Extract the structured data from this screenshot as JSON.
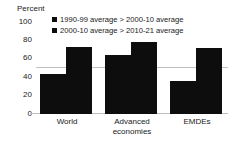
{
  "chart_data": {
    "type": "bar",
    "title": "",
    "xlabel": "",
    "ylabel": "Percent",
    "ylim": [
      0,
      100
    ],
    "yticks": [
      0,
      20,
      40,
      60,
      80,
      100
    ],
    "grid": true,
    "gridlines": [
      50
    ],
    "legend_position": "top",
    "categories": [
      "World",
      "Advanced economies",
      "EMDEs"
    ],
    "category_lines": [
      [
        "World"
      ],
      [
        "Advanced",
        "economies"
      ],
      [
        "EMDEs"
      ]
    ],
    "series": [
      {
        "name": "1990-99 average > 2000-10 average",
        "values": [
          44,
          64,
          36
        ]
      },
      {
        "name": "2000-10 average > 2010-21 average",
        "values": [
          73,
          78,
          72
        ]
      }
    ]
  },
  "colors": {
    "series_1": "#0d0d0d",
    "series_2": "#0d0d0d",
    "gridline": "#bfbfbf",
    "text": "#222222",
    "background": "#ffffff"
  },
  "axis": {
    "title": "Percent",
    "ticks": [
      "100",
      "80",
      "60",
      "40",
      "20",
      "0"
    ]
  },
  "legend": {
    "items": [
      {
        "label": "1990-99 average > 2000-10 average",
        "marker": "square-marker"
      },
      {
        "label": "2000-10 average > 2010-21 average",
        "marker": "square-marker"
      }
    ]
  },
  "xlabels": {
    "world": "World",
    "advanced_line1": "Advanced",
    "advanced_line2": "economies",
    "emdes": "EMDEs"
  }
}
